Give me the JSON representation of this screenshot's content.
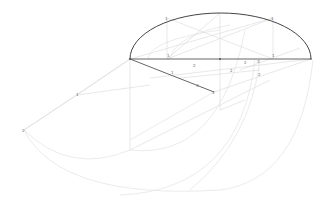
{
  "diagram": {
    "type": "geometric construction (ellipse by concentric circles / division method)",
    "colors": {
      "main_line": "#555555",
      "construction_line": "#d4d4d4",
      "ellipse": "#444444",
      "label": "#666666"
    },
    "labels": {
      "top_left": "1",
      "top_right": "1",
      "axis_left_div": "1",
      "axis_mid_a": "2",
      "axis_mid_b": "3",
      "axis_right_div": "1",
      "incline_1": "1",
      "incline_2": "2",
      "incline_3": "3",
      "incline_end": "3",
      "mid_point": "2",
      "right_point": "2",
      "left_point": "1",
      "far_left": "2"
    }
  }
}
